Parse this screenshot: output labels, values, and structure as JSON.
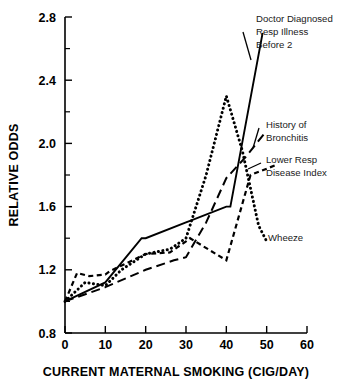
{
  "chart_data": {
    "type": "line",
    "title": "",
    "xlabel": "CURRENT MATERNAL SMOKING (CIG/DAY)",
    "ylabel": "RELATIVE ODDS",
    "xlim": [
      0,
      60
    ],
    "ylim": [
      0.8,
      2.8
    ],
    "xticks": [
      0,
      10,
      20,
      30,
      40,
      50,
      60
    ],
    "xticklabels": [
      "0",
      "10",
      "20",
      "30",
      "40",
      "50",
      "60"
    ],
    "yticks": [
      0.8,
      1.2,
      1.6,
      2.0,
      2.4,
      2.8
    ],
    "yticklabels": [
      "0.8",
      "1.2",
      "1.6",
      "2.0",
      "2.4",
      "2.8"
    ],
    "y_minor_ticks": [
      1.0,
      1.4,
      1.8,
      2.2,
      2.6
    ],
    "grid": false,
    "legend_position": "inline-annotations",
    "series": [
      {
        "name": "Doctor Diagnosed Resp Illness Before 2",
        "style": "solid",
        "x": [
          0,
          10,
          19,
          20,
          30,
          31,
          40,
          41,
          49
        ],
        "y": [
          1.0,
          1.12,
          1.4,
          1.4,
          1.5,
          1.51,
          1.6,
          1.6,
          2.7
        ]
      },
      {
        "name": "History of Bronchitis",
        "style": "long-dash",
        "x": [
          0,
          10,
          20,
          27,
          30,
          35,
          40,
          45,
          50
        ],
        "y": [
          1.0,
          1.09,
          1.2,
          1.26,
          1.28,
          1.5,
          1.78,
          1.92,
          2.08
        ]
      },
      {
        "name": "Lower Resp Disease Index",
        "style": "dash",
        "x": [
          0,
          3,
          6,
          10,
          11,
          20,
          26,
          30,
          31,
          40,
          46,
          52
        ],
        "y": [
          1.0,
          1.18,
          1.16,
          1.17,
          1.19,
          1.3,
          1.31,
          1.38,
          1.4,
          1.26,
          1.8,
          1.86
        ]
      },
      {
        "name": "Wheeze",
        "style": "dotted",
        "x": [
          0,
          5,
          10,
          14,
          20,
          26,
          30,
          35,
          40,
          44,
          48,
          50
        ],
        "y": [
          1.0,
          1.12,
          1.1,
          1.2,
          1.3,
          1.33,
          1.4,
          1.8,
          2.3,
          1.95,
          1.48,
          1.38
        ]
      }
    ],
    "annotations": [
      {
        "id": "ddri",
        "lines": [
          "Doctor Diagnosed",
          "Resp Illness",
          "Before 2"
        ],
        "for_series": "Doctor Diagnosed Resp Illness Before 2"
      },
      {
        "id": "bronchitis",
        "lines": [
          "History of",
          "Bronchitis"
        ],
        "for_series": "History of Bronchitis"
      },
      {
        "id": "lrdi",
        "lines": [
          "Lower Resp",
          "Disease Index"
        ],
        "for_series": "Lower Resp Disease Index"
      },
      {
        "id": "wheeze",
        "lines": [
          "Wheeze"
        ],
        "for_series": "Wheeze"
      }
    ],
    "colors": {
      "axis": "#000000",
      "series": "#000000",
      "background": "#ffffff"
    }
  },
  "axis": {
    "x_title": "CURRENT MATERNAL SMOKING (CIG/DAY)",
    "y_title": "RELATIVE ODDS",
    "x_labels": [
      "0",
      "10",
      "20",
      "30",
      "40",
      "50",
      "60"
    ],
    "y_labels": [
      "2.8",
      "2.4",
      "2.0",
      "1.6",
      "1.2",
      "0.8"
    ]
  },
  "annotations": {
    "ddri_l1": "Doctor Diagnosed",
    "ddri_l2": "Resp Illness",
    "ddri_l3": "Before 2",
    "bronchitis_l1": "History of",
    "bronchitis_l2": "Bronchitis",
    "lrdi_l1": "Lower Resp",
    "lrdi_l2": "Disease Index",
    "wheeze_l1": "Wheeze"
  }
}
